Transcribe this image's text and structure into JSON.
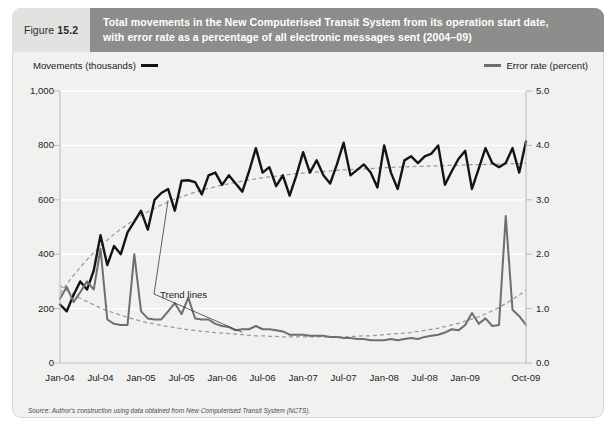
{
  "figure": {
    "label_word": "Figure",
    "label_number": "15.2",
    "title_line1": "Total movements in the New Computerised Transit System from its operation start date,",
    "title_line2": "with error rate as a percentage of all electronic messages sent (2004–09)",
    "banner_color": "#8d8d8b",
    "fignum_bg": "#e2e2e0",
    "panel_bg": "#f1f1f0"
  },
  "source_note": "Source: Author's construction using data obtained from New Computerised Transit System (NCTS).",
  "annotations": {
    "trend_lines_label": "Trend lines"
  },
  "chart_data": {
    "type": "line",
    "title": "Total movements in the New Computerised Transit System from its operation start date, with error rate as a percentage of all electronic messages sent (2004–09)",
    "xlabel": "",
    "grid": true,
    "legend_position": "top",
    "left_axis": {
      "label": "Movements (thousands)",
      "ticks": [
        "0",
        "200",
        "400",
        "600",
        "800",
        "1,000"
      ],
      "tick_values": [
        0,
        200,
        400,
        600,
        800,
        1000
      ],
      "ylim": [
        0,
        1000
      ],
      "color": "#141414"
    },
    "right_axis": {
      "label": "Error rate (percent)",
      "ticks": [
        "0.0",
        "1.0",
        "2.0",
        "3.0",
        "4.0",
        "5.0"
      ],
      "tick_values": [
        0.0,
        1.0,
        2.0,
        3.0,
        4.0,
        5.0
      ],
      "ylim": [
        0,
        5
      ],
      "color": "#6e6e6e"
    },
    "x_tick_labels": [
      "Jan-04",
      "Jul-04",
      "Jan-05",
      "Jul-05",
      "Jan-06",
      "Jul-06",
      "Jan-07",
      "Jul-07",
      "Jan-08",
      "Jul-08",
      "Jan-09",
      "Oct-09"
    ],
    "x_tick_indices": [
      0,
      6,
      12,
      18,
      24,
      30,
      36,
      42,
      48,
      54,
      60,
      69
    ],
    "n_points": 70,
    "series": [
      {
        "name": "Movements (thousands)",
        "axis": "left",
        "color": "#141414",
        "style": "solid",
        "values": [
          215,
          190,
          250,
          300,
          270,
          340,
          470,
          360,
          430,
          400,
          480,
          520,
          560,
          490,
          600,
          625,
          640,
          560,
          670,
          672,
          665,
          620,
          690,
          700,
          655,
          690,
          660,
          630,
          705,
          790,
          700,
          720,
          650,
          690,
          615,
          690,
          775,
          700,
          745,
          690,
          660,
          730,
          810,
          690,
          710,
          730,
          700,
          645,
          800,
          700,
          640,
          745,
          760,
          735,
          760,
          770,
          800,
          655,
          705,
          750,
          780,
          640,
          715,
          790,
          735,
          720,
          735,
          790,
          700,
          815
        ]
      },
      {
        "name": "Error rate (percent)",
        "axis": "right",
        "color": "#6e6e6e",
        "style": "solid",
        "values": [
          1.18,
          1.4,
          1.12,
          1.3,
          1.5,
          1.35,
          2.1,
          0.8,
          0.72,
          0.7,
          0.7,
          2.0,
          0.95,
          0.82,
          0.8,
          0.8,
          0.95,
          1.1,
          0.9,
          1.2,
          0.82,
          0.8,
          0.8,
          0.72,
          0.68,
          0.66,
          0.6,
          0.62,
          0.62,
          0.68,
          0.62,
          0.62,
          0.6,
          0.58,
          0.52,
          0.52,
          0.52,
          0.5,
          0.5,
          0.5,
          0.48,
          0.48,
          0.46,
          0.46,
          0.44,
          0.44,
          0.42,
          0.42,
          0.42,
          0.44,
          0.42,
          0.44,
          0.46,
          0.44,
          0.48,
          0.5,
          0.52,
          0.56,
          0.62,
          0.6,
          0.7,
          0.92,
          0.72,
          0.82,
          0.68,
          0.7,
          2.7,
          0.98,
          0.86,
          0.7
        ]
      }
    ],
    "trend_series": [
      {
        "name": "Movements trend",
        "axis": "left",
        "color": "#9a9a9a",
        "style": "dashed",
        "values": [
          255,
          290,
          322,
          352,
          380,
          406,
          430,
          452,
          473,
          492,
          510,
          527,
          542,
          556,
          569,
          581,
          592,
          602,
          611,
          620,
          628,
          635,
          642,
          648,
          654,
          659,
          664,
          669,
          673,
          677,
          681,
          684,
          687,
          690,
          693,
          696,
          698,
          700,
          702,
          704,
          706,
          708,
          710,
          711,
          713,
          714,
          715,
          716,
          718,
          719,
          720,
          721,
          722,
          723,
          724,
          724,
          725,
          726,
          727,
          727,
          728,
          729,
          729,
          730,
          731,
          731,
          732,
          733,
          733,
          734
        ]
      },
      {
        "name": "Error rate trend",
        "axis": "right",
        "color": "#9a9a9a",
        "style": "dashed",
        "values": [
          1.42,
          1.34,
          1.26,
          1.19,
          1.13,
          1.07,
          1.01,
          0.96,
          0.92,
          0.88,
          0.84,
          0.8,
          0.77,
          0.74,
          0.72,
          0.69,
          0.67,
          0.65,
          0.63,
          0.61,
          0.6,
          0.58,
          0.57,
          0.56,
          0.55,
          0.54,
          0.53,
          0.52,
          0.51,
          0.5,
          0.5,
          0.49,
          0.49,
          0.48,
          0.48,
          0.48,
          0.48,
          0.48,
          0.48,
          0.48,
          0.48,
          0.48,
          0.48,
          0.49,
          0.49,
          0.5,
          0.5,
          0.51,
          0.52,
          0.53,
          0.54,
          0.55,
          0.56,
          0.58,
          0.6,
          0.62,
          0.64,
          0.67,
          0.7,
          0.73,
          0.77,
          0.81,
          0.85,
          0.9,
          0.96,
          1.02,
          1.09,
          1.17,
          1.25,
          1.34
        ]
      }
    ]
  }
}
